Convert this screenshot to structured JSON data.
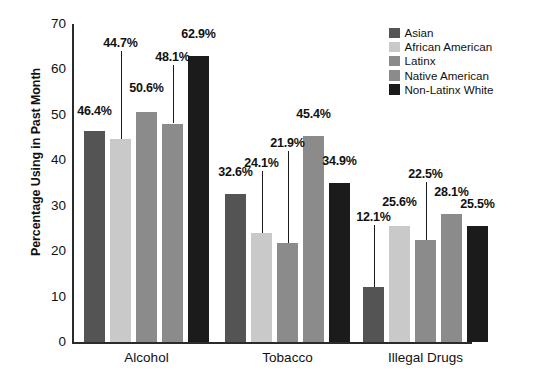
{
  "chart_data": {
    "type": "bar",
    "title": "",
    "xlabel": "",
    "ylabel": "Percentage Using in Past Month",
    "ylim": [
      0,
      70
    ],
    "yticks": [
      "0",
      "10",
      "20",
      "30",
      "40",
      "50",
      "60",
      "70"
    ],
    "grid": false,
    "legend_position": "top-right",
    "categories": [
      "Alcohol",
      "Tobacco",
      "Illegal Drugs"
    ],
    "series": [
      {
        "name": "Asian",
        "color": "#545454",
        "values": [
          46.4,
          32.6,
          12.1
        ],
        "labels": [
          "46.4%",
          "32.6%",
          "12.1%"
        ]
      },
      {
        "name": "African American",
        "color": "#c9c9c9",
        "values": [
          44.7,
          24.1,
          25.6
        ],
        "labels": [
          "44.7%",
          "24.1%",
          "25.6%"
        ]
      },
      {
        "name": "Latinx",
        "color": "#8b8b8b",
        "values": [
          50.6,
          21.9,
          22.5
        ],
        "labels": [
          "50.6%",
          "21.9%",
          "22.5%"
        ]
      },
      {
        "name": "Native American",
        "color": "#8b8b8b",
        "values": [
          48.1,
          45.4,
          28.1
        ],
        "labels": [
          "48.1%",
          "45.4%",
          "28.1%"
        ]
      },
      {
        "name": "Non-Latinx White",
        "color": "#1b1b1b",
        "values": [
          62.9,
          34.9,
          25.5
        ],
        "labels": [
          "62.9%",
          "34.9%",
          "25.5%"
        ]
      }
    ]
  },
  "axis": {
    "y_title": "Percentage Using in Past Month"
  },
  "legend": {
    "items": [
      {
        "label": "Asian",
        "color": "#545454"
      },
      {
        "label": "African American",
        "color": "#c9c9c9"
      },
      {
        "label": "Latinx",
        "color": "#8b8b8b"
      },
      {
        "label": "Native American",
        "color": "#8b8b8b"
      },
      {
        "label": "Non-Latinx White",
        "color": "#1b1b1b"
      }
    ]
  }
}
